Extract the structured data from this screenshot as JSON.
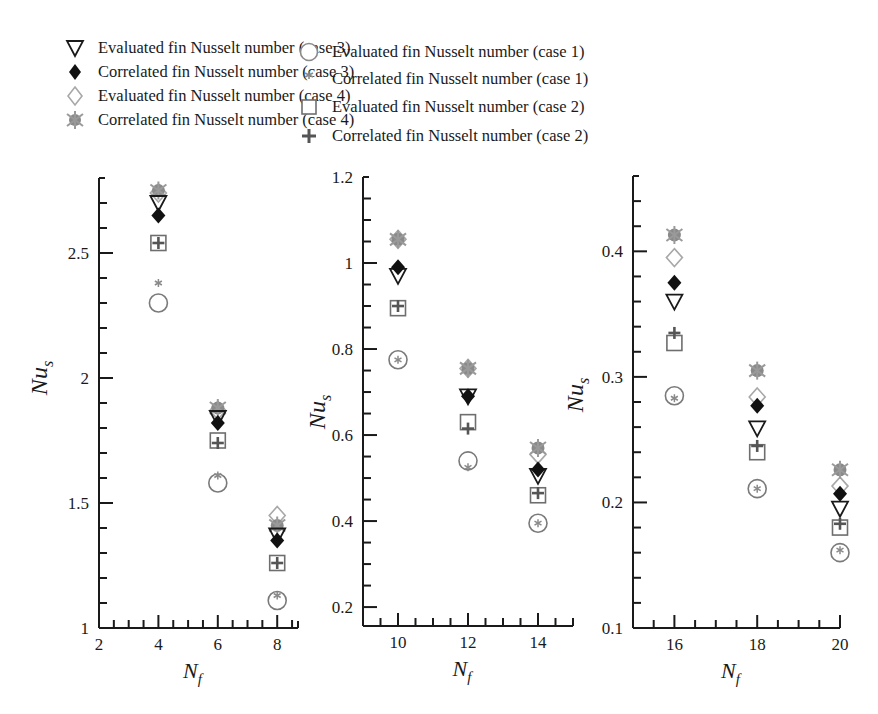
{
  "legend": {
    "left_column": [
      {
        "series": "eval_case3",
        "label": "Evaluated fin Nusselt number (case 3)",
        "marker": "triangle-down-open-icon"
      },
      {
        "series": "corr_case3",
        "label": "Correlated fin Nusselt number (case 3)",
        "marker": "diamond-filled-black-icon"
      },
      {
        "series": "eval_case4",
        "label": "Evaluated fin Nusselt number (case 4)",
        "marker": "diamond-open-icon"
      },
      {
        "series": "corr_case4",
        "label": "Correlated fin Nusselt number (case 4)",
        "marker": "gear-star-filled-gray-icon"
      }
    ],
    "right_column": [
      {
        "series": "eval_case1",
        "label": "Evaluated fin Nusselt number (case 1)",
        "marker": "circle-open-icon"
      },
      {
        "series": "corr_case1",
        "label": "Correlated fin Nusselt number (case 1)",
        "marker": "asterisk-icon"
      },
      {
        "series": "eval_case2",
        "label": "Evaluated fin Nusselt number (case 2)",
        "marker": "square-open-icon"
      },
      {
        "series": "corr_case2",
        "label": "Correlated fin Nusselt number (case 2)",
        "marker": "plus-icon"
      }
    ]
  },
  "colors": {
    "axis": "#1a1a1a",
    "black_marker": "#111111",
    "gray_marker": "#8a8a8a",
    "gray_outline": "#7a7a7a",
    "light_outline": "#a8a8a8"
  },
  "chart_data": [
    {
      "type": "scatter",
      "title": "",
      "xlabel": "N_f",
      "ylabel": "Nu_s",
      "xlim": [
        2,
        8.7
      ],
      "ylim": [
        1,
        2.8
      ],
      "xticks": [
        2,
        4,
        6,
        8
      ],
      "xtick_labels": [
        "2",
        "4",
        "6",
        "8"
      ],
      "yticks": [
        1,
        1.5,
        2,
        2.5
      ],
      "ytick_labels": [
        "1",
        "1.5",
        "2",
        "2.5"
      ],
      "minor_x_step": 0.5,
      "minor_y_step": 0.1,
      "grid": false,
      "x": [
        4,
        6,
        8
      ],
      "series": [
        {
          "name": "Evaluated fin Nusselt number (case 3)",
          "key": "eval_case3",
          "values": [
            2.7,
            1.84,
            1.37
          ]
        },
        {
          "name": "Correlated fin Nusselt number (case 3)",
          "key": "corr_case3",
          "values": [
            2.65,
            1.82,
            1.35
          ]
        },
        {
          "name": "Evaluated fin Nusselt number (case 4)",
          "key": "eval_case4",
          "values": [
            2.74,
            1.87,
            1.45
          ]
        },
        {
          "name": "Correlated fin Nusselt number (case 4)",
          "key": "corr_case4",
          "values": [
            2.75,
            1.88,
            1.41
          ]
        },
        {
          "name": "Evaluated fin Nusselt number (case 1)",
          "key": "eval_case1",
          "values": [
            2.3,
            1.58,
            1.11
          ]
        },
        {
          "name": "Correlated fin Nusselt number (case 1)",
          "key": "corr_case1",
          "values": [
            2.38,
            1.61,
            1.13
          ]
        },
        {
          "name": "Evaluated fin Nusselt number (case 2)",
          "key": "eval_case2",
          "values": [
            2.54,
            1.75,
            1.26
          ]
        },
        {
          "name": "Correlated fin Nusselt number (case 2)",
          "key": "corr_case2",
          "values": [
            2.54,
            1.74,
            1.26
          ]
        }
      ]
    },
    {
      "type": "scatter",
      "title": "",
      "xlabel": "N_f",
      "ylabel": "Nu_s",
      "xlim": [
        9,
        15
      ],
      "ylim": [
        0.156,
        1.2
      ],
      "xticks": [
        10,
        12,
        14
      ],
      "xtick_labels": [
        "10",
        "12",
        "14"
      ],
      "yticks": [
        0.2,
        0.4,
        0.6,
        0.8,
        1.0,
        1.2
      ],
      "ytick_labels": [
        "0.2",
        "0.4",
        "0.6",
        "0.8",
        "1",
        "1.2"
      ],
      "minor_x_step": 0.5,
      "minor_y_step": 0.05,
      "grid": false,
      "x": [
        10,
        12,
        14
      ],
      "series": [
        {
          "name": "Evaluated fin Nusselt number (case 3)",
          "key": "eval_case3",
          "values": [
            0.97,
            0.69,
            0.505
          ]
        },
        {
          "name": "Correlated fin Nusselt number (case 3)",
          "key": "corr_case3",
          "values": [
            0.99,
            0.69,
            0.52
          ]
        },
        {
          "name": "Evaluated fin Nusselt number (case 4)",
          "key": "eval_case4",
          "values": [
            1.055,
            0.755,
            0.555
          ]
        },
        {
          "name": "Correlated fin Nusselt number (case 4)",
          "key": "corr_case4",
          "values": [
            1.055,
            0.755,
            0.57
          ]
        },
        {
          "name": "Evaluated fin Nusselt number (case 1)",
          "key": "eval_case1",
          "values": [
            0.775,
            0.54,
            0.395
          ]
        },
        {
          "name": "Correlated fin Nusselt number (case 1)",
          "key": "corr_case1",
          "values": [
            0.775,
            0.525,
            0.395
          ]
        },
        {
          "name": "Evaluated fin Nusselt number (case 2)",
          "key": "eval_case2",
          "values": [
            0.895,
            0.63,
            0.46
          ]
        },
        {
          "name": "Correlated fin Nusselt number (case 2)",
          "key": "corr_case2",
          "values": [
            0.9,
            0.615,
            0.465
          ]
        }
      ]
    },
    {
      "type": "scatter",
      "title": "",
      "xlabel": "N_f",
      "ylabel": "Nu_s",
      "xlim": [
        15,
        20
      ],
      "ylim": [
        0.1,
        0.46
      ],
      "xticks": [
        16,
        18,
        20
      ],
      "xtick_labels": [
        "16",
        "18",
        "20"
      ],
      "yticks": [
        0.1,
        0.2,
        0.3,
        0.4
      ],
      "ytick_labels": [
        "0.1",
        "0.2",
        "0.3",
        "0.4"
      ],
      "minor_x_step": 0.5,
      "minor_y_step": 0.02,
      "grid": false,
      "x": [
        16,
        18,
        20
      ],
      "series": [
        {
          "name": "Evaluated fin Nusselt number (case 3)",
          "key": "eval_case3",
          "values": [
            0.36,
            0.259,
            0.195
          ]
        },
        {
          "name": "Correlated fin Nusselt number (case 3)",
          "key": "corr_case3",
          "values": [
            0.375,
            0.277,
            0.207
          ]
        },
        {
          "name": "Evaluated fin Nusselt number (case 4)",
          "key": "eval_case4",
          "values": [
            0.395,
            0.284,
            0.213
          ]
        },
        {
          "name": "Correlated fin Nusselt number (case 4)",
          "key": "corr_case4",
          "values": [
            0.413,
            0.305,
            0.226
          ]
        },
        {
          "name": "Evaluated fin Nusselt number (case 1)",
          "key": "eval_case1",
          "values": [
            0.285,
            0.211,
            0.16
          ]
        },
        {
          "name": "Correlated fin Nusselt number (case 1)",
          "key": "corr_case1",
          "values": [
            0.283,
            0.211,
            0.162
          ]
        },
        {
          "name": "Evaluated fin Nusselt number (case 2)",
          "key": "eval_case2",
          "values": [
            0.327,
            0.24,
            0.18
          ]
        },
        {
          "name": "Correlated fin Nusselt number (case 2)",
          "key": "corr_case2",
          "values": [
            0.335,
            0.245,
            0.183
          ]
        }
      ]
    }
  ],
  "panels_layout": [
    {
      "x0": 99,
      "x1": 298,
      "y_top": 178,
      "y_base": 628,
      "xmin": 2,
      "xmax": 8.7
    },
    {
      "x0": 363,
      "x1": 573,
      "y_top": 177,
      "y_base": 626,
      "xmin": 9,
      "xmax": 15
    },
    {
      "x0": 633,
      "x1": 840,
      "y_top": 176,
      "y_base": 628,
      "xmin": 15,
      "xmax": 20
    }
  ]
}
